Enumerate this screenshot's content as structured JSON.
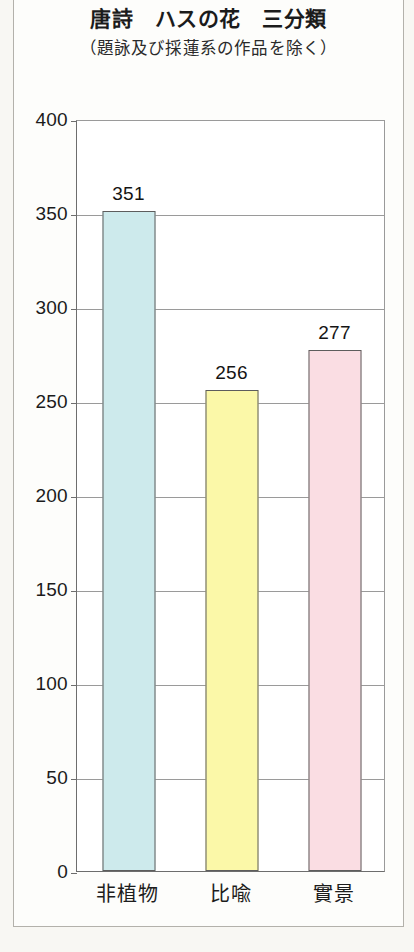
{
  "chart_data": {
    "type": "bar",
    "title": "唐詩　ハスの花　三分類",
    "subtitle": "（題詠及び採蓮系の作品を除く）",
    "categories": [
      "非植物",
      "比喩",
      "實景"
    ],
    "values": [
      351,
      256,
      277
    ],
    "value_labels": [
      "351",
      "256",
      "277"
    ],
    "xlabel": "",
    "ylabel": "",
    "ylim": [
      0,
      400
    ],
    "ytick_step": 50,
    "yticks": [
      0,
      50,
      100,
      150,
      200,
      250,
      300,
      350,
      400
    ],
    "ytick_labels": [
      "0",
      "50",
      "100",
      "150",
      "200",
      "250",
      "300",
      "350",
      "400"
    ],
    "grid": true,
    "legend": false,
    "bar_colors": [
      "#cdeaec",
      "#fbf8a8",
      "#fadde3"
    ],
    "bar_border_color": "#5d5d5d",
    "axis_color": "#6d6d6d",
    "gridline_color": "#9a9a9a",
    "plot_background": "#ffffff",
    "page_background": "#f8f7f3"
  }
}
